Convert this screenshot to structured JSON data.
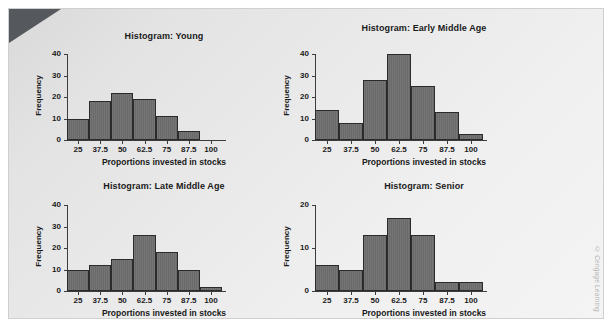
{
  "figure": {
    "watermark": "© Cengage Learning",
    "background_color": "#ececec",
    "bar_color": "#6d6d6d",
    "bar_edge_color": "#2b2b2b",
    "axis_color": "#3c3c3c"
  },
  "chart_data": [
    {
      "type": "bar",
      "title": "Histogram: Young",
      "xlabel": "Proportions invested in stocks",
      "ylabel": "Frequency",
      "xticks": [
        "25",
        "37.5",
        "50",
        "62.5",
        "75",
        "87.5",
        "100"
      ],
      "yticks": [
        "0",
        "10",
        "20",
        "30",
        "40"
      ],
      "ylim": [
        0,
        40
      ],
      "xlim": [
        18.75,
        106.25
      ],
      "bin_edges": [
        18.75,
        31.25,
        43.75,
        56.25,
        68.75,
        81.25,
        93.75
      ],
      "bin_width": 12.5,
      "categories": [
        "18.75-31.25",
        "31.25-43.75",
        "43.75-56.25",
        "56.25-68.75",
        "68.75-81.25",
        "81.25-93.75"
      ],
      "values": [
        10,
        18,
        22,
        19,
        11,
        4
      ],
      "grid": false,
      "legend": "none"
    },
    {
      "type": "bar",
      "title": "Histogram: Early Middle Age",
      "xlabel": "Proportions invested in stocks",
      "ylabel": "Frequency",
      "xticks": [
        "25",
        "37.5",
        "50",
        "62.5",
        "75",
        "87.5",
        "100"
      ],
      "yticks": [
        "0",
        "10",
        "20",
        "30",
        "40"
      ],
      "ylim": [
        0,
        40
      ],
      "xlim": [
        18.75,
        106.25
      ],
      "bin_edges": [
        18.75,
        31.25,
        43.75,
        56.25,
        68.75,
        81.25,
        93.75,
        106.25
      ],
      "bin_width": 12.5,
      "categories": [
        "18.75-31.25",
        "31.25-43.75",
        "43.75-56.25",
        "56.25-68.75",
        "68.75-81.25",
        "81.25-93.75",
        "93.75-106.25"
      ],
      "values": [
        14,
        8,
        28,
        40,
        25,
        13,
        3
      ],
      "grid": false,
      "legend": "none"
    },
    {
      "type": "bar",
      "title": "Histogram: Late Middle Age",
      "xlabel": "Proportions invested in stocks",
      "ylabel": "Frequency",
      "xticks": [
        "25",
        "37.5",
        "50",
        "62.5",
        "75",
        "87.5",
        "100"
      ],
      "yticks": [
        "0",
        "10",
        "20",
        "30",
        "40"
      ],
      "ylim": [
        0,
        40
      ],
      "xlim": [
        18.75,
        106.25
      ],
      "bin_edges": [
        18.75,
        31.25,
        43.75,
        56.25,
        68.75,
        81.25,
        93.75,
        106.25
      ],
      "bin_width": 12.5,
      "categories": [
        "18.75-31.25",
        "31.25-43.75",
        "43.75-56.25",
        "56.25-68.75",
        "68.75-81.25",
        "81.25-93.75",
        "93.75-106.25"
      ],
      "values": [
        10,
        12,
        15,
        26,
        18,
        10,
        2
      ],
      "grid": false,
      "legend": "none"
    },
    {
      "type": "bar",
      "title": "Histogram: Senior",
      "xlabel": "Proportions invested in stocks",
      "ylabel": "Frequency",
      "xticks": [
        "25",
        "37.5",
        "50",
        "62.5",
        "75",
        "87.5",
        "100"
      ],
      "yticks": [
        "0",
        "10",
        "20"
      ],
      "ylim": [
        0,
        20
      ],
      "xlim": [
        18.75,
        106.25
      ],
      "bin_edges": [
        18.75,
        31.25,
        43.75,
        56.25,
        68.75,
        81.25,
        93.75,
        106.25
      ],
      "bin_width": 12.5,
      "categories": [
        "18.75-31.25",
        "31.25-43.75",
        "43.75-56.25",
        "56.25-68.75",
        "68.75-81.25",
        "81.25-93.75",
        "93.75-106.25"
      ],
      "values": [
        6,
        5,
        13,
        17,
        13,
        2,
        2
      ],
      "grid": false,
      "legend": "none"
    }
  ]
}
